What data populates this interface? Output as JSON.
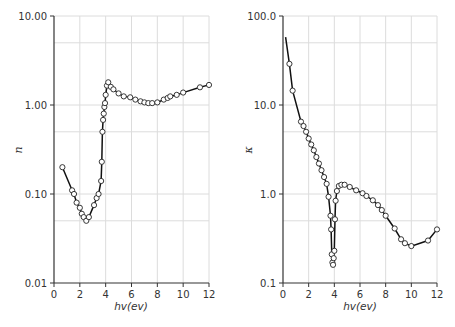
{
  "chart_data": [
    {
      "type": "line",
      "title": "",
      "xlabel": "hv(ev)",
      "ylabel": "n",
      "yscale": "log",
      "xlim": [
        0,
        12
      ],
      "ylim": [
        0.01,
        10
      ],
      "x_ticks": [
        "0",
        "2",
        "4",
        "6",
        "8",
        "10",
        "12"
      ],
      "y_ticks": [
        "10.00",
        "1.00",
        "0.10",
        "0.01"
      ],
      "grid": true,
      "legend": null,
      "series": [
        {
          "name": "n",
          "marker": "open-circle",
          "x": [
            0.65,
            1.4,
            1.55,
            1.75,
            2.0,
            2.15,
            2.3,
            2.5,
            2.7,
            3.1,
            3.3,
            3.45,
            3.65,
            3.7,
            3.75,
            3.8,
            3.85,
            3.9,
            3.95,
            4.0,
            4.1,
            4.2,
            4.4,
            4.6,
            5.0,
            5.4,
            5.9,
            6.3,
            6.7,
            7.0,
            7.3,
            7.6,
            8.0,
            8.5,
            8.8,
            9.0,
            9.5,
            10.0,
            11.3,
            12.0
          ],
          "y": [
            0.2,
            0.11,
            0.1,
            0.08,
            0.07,
            0.06,
            0.055,
            0.05,
            0.055,
            0.075,
            0.09,
            0.1,
            0.14,
            0.23,
            0.5,
            0.68,
            0.8,
            0.95,
            1.05,
            1.3,
            1.65,
            1.8,
            1.6,
            1.5,
            1.35,
            1.25,
            1.22,
            1.15,
            1.1,
            1.07,
            1.05,
            1.05,
            1.07,
            1.15,
            1.2,
            1.25,
            1.3,
            1.38,
            1.58,
            1.68
          ]
        }
      ]
    },
    {
      "type": "line",
      "title": "",
      "xlabel": "hv(ev)",
      "ylabel": "κ",
      "yscale": "log",
      "xlim": [
        0,
        12
      ],
      "ylim": [
        0.1,
        100
      ],
      "x_ticks": [
        "0",
        "2",
        "4",
        "6",
        "8",
        "10",
        "12"
      ],
      "y_ticks": [
        "100.0",
        "10.0",
        "1.0",
        "0.1"
      ],
      "grid": true,
      "legend": null,
      "series": [
        {
          "name": "κ",
          "marker": "open-circle",
          "curve_start": {
            "x": 0.2,
            "y": 58
          },
          "x": [
            0.5,
            0.75,
            1.4,
            1.6,
            1.8,
            2.0,
            2.2,
            2.4,
            2.6,
            2.8,
            3.0,
            3.2,
            3.4,
            3.55,
            3.7,
            3.75,
            3.8,
            3.85,
            3.9,
            3.95,
            4.0,
            4.05,
            4.1,
            4.2,
            4.35,
            4.55,
            4.8,
            5.2,
            5.7,
            6.2,
            6.5,
            7.0,
            7.4,
            7.7,
            8.0,
            8.7,
            9.2,
            9.5,
            10.0,
            11.3,
            12.0
          ],
          "y": [
            29,
            14.5,
            6.5,
            5.8,
            5.0,
            4.2,
            3.6,
            3.1,
            2.6,
            2.2,
            1.85,
            1.55,
            1.3,
            0.93,
            0.57,
            0.4,
            0.21,
            0.17,
            0.16,
            0.19,
            0.23,
            0.52,
            0.84,
            1.08,
            1.23,
            1.27,
            1.27,
            1.2,
            1.1,
            1.02,
            0.95,
            0.85,
            0.75,
            0.66,
            0.57,
            0.41,
            0.31,
            0.28,
            0.26,
            0.3,
            0.4
          ]
        }
      ]
    }
  ]
}
